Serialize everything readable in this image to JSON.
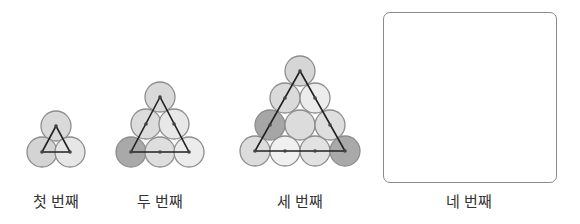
{
  "figures": [
    {
      "label": "첫 번째",
      "label_x": 56,
      "radius": 15,
      "circles": [
        {
          "cx": 56,
          "cy": 126,
          "fill": "#d9d9d9"
        },
        {
          "cx": 42,
          "cy": 152,
          "fill": "#d4d4d4"
        },
        {
          "cx": 70,
          "cy": 152,
          "fill": "#e6e6e6"
        }
      ],
      "triangle": [
        [
          56,
          126
        ],
        [
          42,
          152
        ],
        [
          70,
          152
        ]
      ],
      "dots": [
        [
          56,
          126
        ],
        [
          42,
          152
        ],
        [
          70,
          152
        ]
      ]
    },
    {
      "label": "두 번째",
      "label_x": 160,
      "radius": 15,
      "circles": [
        {
          "cx": 160,
          "cy": 97,
          "fill": "#d9d9d9"
        },
        {
          "cx": 146,
          "cy": 124,
          "fill": "#dcdcdc"
        },
        {
          "cx": 174,
          "cy": 124,
          "fill": "#e8e8e8"
        },
        {
          "cx": 131,
          "cy": 152,
          "fill": "#a9a9a9"
        },
        {
          "cx": 160,
          "cy": 152,
          "fill": "#dedede"
        },
        {
          "cx": 189,
          "cy": 152,
          "fill": "#ececec"
        }
      ],
      "triangle": [
        [
          160,
          97
        ],
        [
          131,
          152
        ],
        [
          189,
          152
        ]
      ],
      "dots": [
        [
          160,
          97
        ],
        [
          146,
          124
        ],
        [
          174,
          124
        ],
        [
          131,
          152
        ],
        [
          160,
          152
        ],
        [
          189,
          152
        ]
      ]
    },
    {
      "label": "세 번째",
      "label_x": 300,
      "radius": 15,
      "circles": [
        {
          "cx": 300,
          "cy": 71,
          "fill": "#d6d6d6"
        },
        {
          "cx": 285,
          "cy": 98,
          "fill": "#dadada"
        },
        {
          "cx": 315,
          "cy": 98,
          "fill": "#ececec"
        },
        {
          "cx": 270,
          "cy": 125,
          "fill": "#a6a6a6"
        },
        {
          "cx": 300,
          "cy": 125,
          "fill": "#dcdcdc"
        },
        {
          "cx": 330,
          "cy": 125,
          "fill": "#dedede"
        },
        {
          "cx": 255,
          "cy": 151,
          "fill": "#dcdcdc"
        },
        {
          "cx": 285,
          "cy": 151,
          "fill": "#f0f0f0"
        },
        {
          "cx": 315,
          "cy": 151,
          "fill": "#e2e2e2"
        },
        {
          "cx": 345,
          "cy": 151,
          "fill": "#a9a9a9"
        }
      ],
      "triangle": [
        [
          300,
          71
        ],
        [
          255,
          151
        ],
        [
          345,
          151
        ]
      ],
      "dots": [
        [
          300,
          71
        ],
        [
          285,
          98
        ],
        [
          315,
          98
        ],
        [
          270,
          125
        ],
        [
          330,
          125
        ],
        [
          255,
          151
        ],
        [
          285,
          151
        ],
        [
          315,
          151
        ],
        [
          345,
          151
        ]
      ]
    }
  ],
  "fourth": {
    "label": "네 번째",
    "label_x": 469
  },
  "colors": {
    "circle_stroke": "#8c8c8c",
    "line": "#222222",
    "dot": "#444444",
    "box_border": "#8a8a8a"
  }
}
